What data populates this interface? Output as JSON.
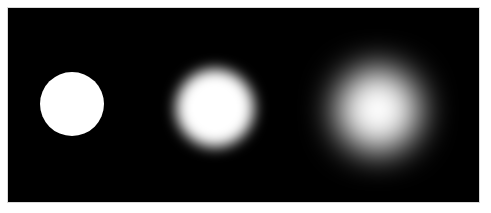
{
  "figure": {
    "title": "",
    "caption": "",
    "canvas": {
      "width": 491,
      "height": 213,
      "background_color": "#ffffff"
    },
    "panel": {
      "name": "image-panel",
      "x": 7,
      "y": 7,
      "width": 473,
      "height": 196,
      "background_color": "#000000",
      "border_color": "#d9d9d9"
    },
    "blob_color": "#ffffff",
    "blobs": [
      {
        "label": "blob-1-sharp",
        "center_x": 72,
        "center_y": 104,
        "diameter": 64,
        "blur_px": 0,
        "description": "sharp-edged white disk, no blur"
      },
      {
        "label": "blob-2-medium-blur",
        "center_x": 215,
        "center_y": 108,
        "diameter": 78,
        "blur_px": 7,
        "description": "white disk with moderate gaussian blur"
      },
      {
        "label": "blob-3-heavy-blur",
        "center_x": 378,
        "center_y": 110,
        "diameter": 84,
        "blur_px": 17,
        "description": "white disk with heavy gaussian blur forming a soft glow"
      }
    ]
  }
}
